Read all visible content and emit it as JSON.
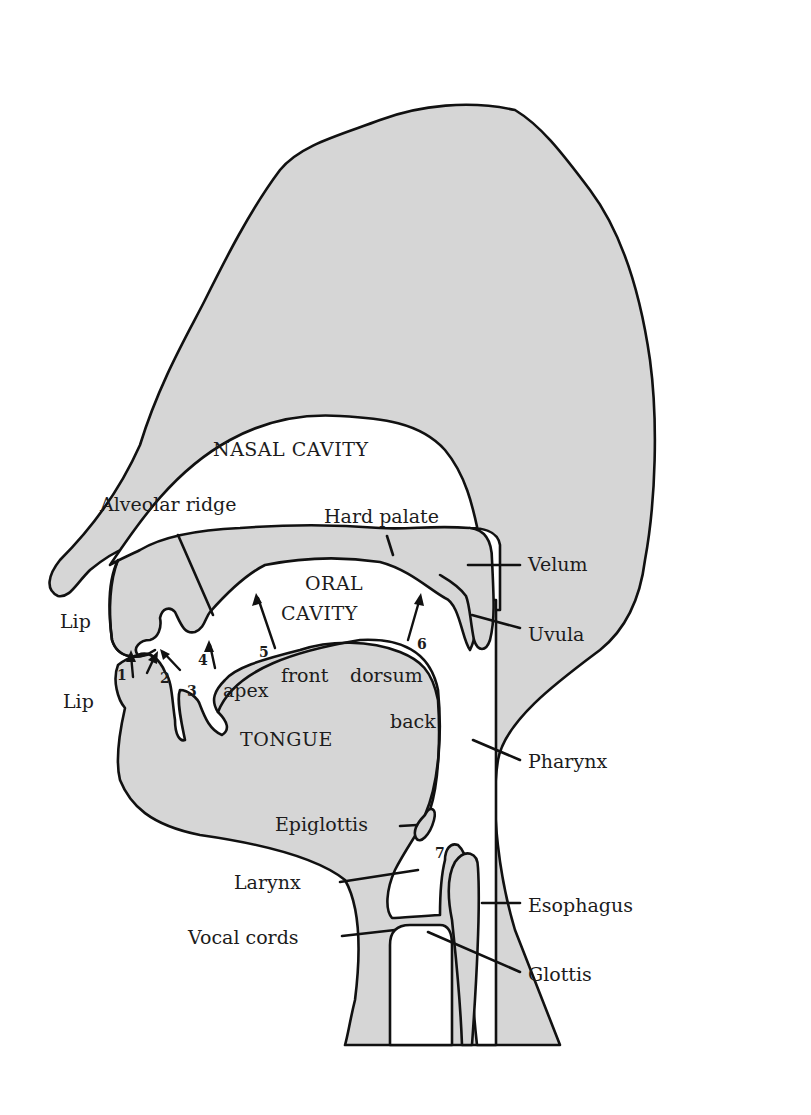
{
  "diagram": {
    "type": "anatomical sagittal section — human vocal tract",
    "colors": {
      "tissue": "#d6d6d6",
      "cavity": "#ffffff",
      "outline": "#111111"
    },
    "regions": {
      "nasal_cavity": "NASAL CAVITY",
      "oral_cavity_line1": "ORAL",
      "oral_cavity_line2": "CAVITY",
      "tongue": "TONGUE"
    },
    "labels": {
      "alveolar_ridge": "Alveolar ridge",
      "hard_palate": "Hard palate",
      "velum": "Velum",
      "uvula": "Uvula",
      "upper_lip": "Lip",
      "lower_lip": "Lip",
      "apex": "apex",
      "front": "front",
      "dorsum": "dorsum",
      "back": "back",
      "pharynx": "Pharynx",
      "epiglottis": "Epiglottis",
      "larynx": "Larynx",
      "esophagus": "Esophagus",
      "vocal_cords": "Vocal cords",
      "glottis": "Glottis"
    },
    "places_of_articulation": [
      "1",
      "2",
      "3",
      "4",
      "5",
      "6",
      "7"
    ]
  }
}
